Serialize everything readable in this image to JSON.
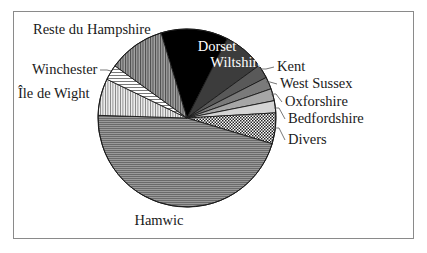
{
  "chart_data": {
    "type": "pie",
    "title": "",
    "start_angle_deg": 343,
    "direction": "clockwise",
    "center": [
      187,
      118
    ],
    "radius": 89,
    "categories": [
      "Dorset",
      "Wiltshire",
      "Kent",
      "West Sussex",
      "Oxforshire",
      "Bedfordshire",
      "Divers",
      "Hamwic",
      "Île de Wight",
      "Winchester",
      "Reste du Hampshire"
    ],
    "values": [
      12.2,
      7.5,
      2.5,
      2.2,
      2.2,
      2.2,
      5.6,
      45.8,
      6.7,
      2.8,
      10.3
    ],
    "unit": "percent (estimated from slice angles)",
    "legend": "none (direct labels)",
    "slices": [
      {
        "label": "Dorset",
        "value": 12.2,
        "fill": "#000000",
        "pattern": "solid",
        "label_pos": [
          217,
          51
        ],
        "label_anchor": "middle",
        "label_inside": true
      },
      {
        "label": "Wiltshire",
        "value": 7.5,
        "fill": "#3c3c3c",
        "pattern": "solid",
        "label_pos": [
          237,
          67
        ],
        "label_anchor": "middle",
        "label_inside": true
      },
      {
        "label": "Kent",
        "value": 2.5,
        "fill": "#595959",
        "pattern": "solid",
        "label_pos": [
          277,
          71
        ],
        "label_anchor": "start",
        "label_inside": false,
        "leader": [
          [
            258,
            69
          ],
          [
            266,
            69
          ],
          [
            274,
            67
          ]
        ]
      },
      {
        "label": "West Sussex",
        "value": 2.2,
        "fill": "#7a7a7a",
        "pattern": "solid",
        "label_pos": [
          280,
          88
        ],
        "label_anchor": "start",
        "label_inside": false,
        "leader": [
          [
            266,
            82
          ],
          [
            270,
            82
          ],
          [
            277,
            84
          ]
        ]
      },
      {
        "label": "Oxforshire",
        "value": 2.2,
        "fill": "#a6a6a6",
        "pattern": "solid",
        "label_pos": [
          285,
          106
        ],
        "label_anchor": "start",
        "label_inside": false,
        "leader": [
          [
            271,
            94
          ],
          [
            276,
            94
          ],
          [
            282,
            102
          ]
        ]
      },
      {
        "label": "Bedfordshire",
        "value": 2.2,
        "fill": "#d4d4d4",
        "pattern": "solid",
        "label_pos": [
          288,
          123
        ],
        "label_anchor": "start",
        "label_inside": false,
        "leader": [
          [
            274,
            108
          ],
          [
            279,
            108
          ],
          [
            285,
            119
          ]
        ]
      },
      {
        "label": "Divers",
        "value": 5.6,
        "fill": "#ffffff",
        "pattern": "checker",
        "label_pos": [
          288,
          144
        ],
        "label_anchor": "start",
        "label_inside": false,
        "leader": [
          [
            273,
            128
          ],
          [
            279,
            128
          ],
          [
            285,
            140
          ]
        ]
      },
      {
        "label": "Hamwic",
        "value": 45.8,
        "fill": "#8c8c8c",
        "pattern": "h-lines",
        "label_pos": [
          159,
          225
        ],
        "label_anchor": "middle",
        "label_inside": false
      },
      {
        "label": "Île de Wight",
        "value": 6.7,
        "fill": "#e6e6e6",
        "pattern": "v-lines",
        "label_pos": [
          18,
          98
        ],
        "label_anchor": "start",
        "label_inside": false
      },
      {
        "label": "Winchester",
        "value": 2.8,
        "fill": "#ffffff",
        "pattern": "h-lines-light",
        "label_pos": [
          32,
          74
        ],
        "label_anchor": "start",
        "label_inside": false,
        "leader": [
          [
            100,
            70
          ],
          [
            107,
            70
          ],
          [
            111,
            71
          ]
        ]
      },
      {
        "label": "Reste du Hampshire",
        "value": 10.3,
        "fill": "#8e8e8e",
        "pattern": "v-lines-dark",
        "label_pos": [
          33,
          34
        ],
        "label_anchor": "start",
        "label_inside": false
      }
    ]
  }
}
